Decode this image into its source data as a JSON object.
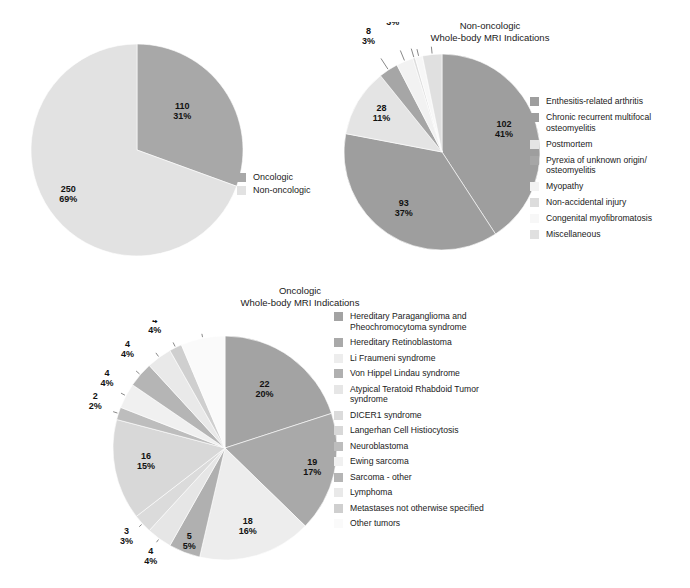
{
  "charts": [
    {
      "id": "overview",
      "title": "",
      "chart_data": {
        "type": "pie",
        "title": "",
        "legend_position": "right",
        "total": 360,
        "categories": [
          "Oncologic",
          "Non-oncologic"
        ],
        "values": [
          110,
          250
        ],
        "percents": [
          "31%",
          "69%"
        ],
        "labels": [
          "110\n31%",
          "250\n69%"
        ],
        "colors": [
          "#a8a8a8",
          "#e2e2e2"
        ]
      }
    },
    {
      "id": "nononc",
      "title": "Non-oncologic\nWhole-body MRI Indications",
      "chart_data": {
        "type": "pie",
        "title": "Non-oncologic Whole-body MRI Indications",
        "legend_position": "right",
        "total": 250,
        "categories": [
          "Enthesitis-related arthritis",
          "Chronic recurrent multifocal\nosteomyelitis",
          "Postmortem",
          "Pyrexia of unknown origin/\nosteomyelitis",
          "Myopathy",
          "Non-accidental injury",
          "Congenital myofibromatosis",
          "Miscellaneous"
        ],
        "values": [
          102,
          93,
          28,
          8,
          7,
          1,
          3,
          8
        ],
        "percents": [
          "41%",
          "37%",
          "11%",
          "3%",
          "3%",
          "1%",
          "1%",
          "3%"
        ],
        "labels": [
          "102\n41%",
          "93\n37%",
          "28\n11%",
          "8\n3%",
          "7\n3%",
          "1\n1%",
          "3\n1%",
          "8\n3%"
        ],
        "colors": [
          "#9e9e9e",
          "#9e9e9e",
          "#e4e4e4",
          "#a6a6a6",
          "#f2f2f2",
          "#dcdcdc",
          "#f7f7f7",
          "#e0e0e0"
        ]
      }
    },
    {
      "id": "onc",
      "title": "Oncologic\nWhole-body MRI Indications",
      "chart_data": {
        "type": "pie",
        "title": "Oncologic Whole-body MRI Indications",
        "legend_position": "right",
        "total": 110,
        "categories": [
          "Hereditary Paraganglioma and\nPheochromocytoma syndrome",
          "Hereditary Retinoblastoma",
          "Li Fraumeni syndrome",
          "Von Hippel Lindau syndrome",
          "Atypical Teratoid Rhabdoid Tumor\nsyndrome",
          "DICER1 syndrome",
          "Langerhan Cell Histiocytosis",
          "Neuroblastoma",
          "Ewing sarcoma",
          "Sarcoma - other",
          "Lymphoma",
          "Metastases not otherwise specified",
          "Other tumors"
        ],
        "values": [
          22,
          19,
          18,
          5,
          4,
          3,
          16,
          2,
          4,
          4,
          4,
          2,
          7
        ],
        "percents": [
          "20%",
          "17%",
          "16%",
          "5%",
          "4%",
          "3%",
          "15%",
          "2%",
          "4%",
          "4%",
          "4%",
          "2%",
          "6%"
        ],
        "labels": [
          "22\n20%",
          "19\n17%",
          "18\n16%",
          "5\n5%",
          "4\n4%",
          "3\n3%",
          "16\n15%",
          "2\n2%",
          "4\n4%",
          "4\n4%",
          "4\n4%",
          "2\n2%",
          "7\n6%"
        ],
        "colors": [
          "#a3a3a3",
          "#a9a9a9",
          "#ededed",
          "#b0b0b0",
          "#e6e6e6",
          "#dbdbdb",
          "#d8d8d8",
          "#bdbdbd",
          "#f0f0f0",
          "#b5b5b5",
          "#e9e9e9",
          "#cfcfcf",
          "#fafafa"
        ]
      }
    }
  ]
}
